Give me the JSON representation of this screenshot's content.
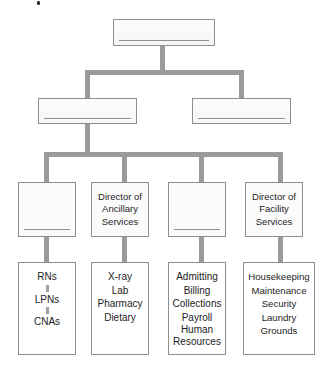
{
  "diagram": {
    "colors": {
      "connector": "#9a9a9a",
      "box_border": "#8e8e8e",
      "box_fill": "#fbfbfb",
      "text": "#1d1d1d",
      "background": "#ffffff"
    },
    "level1": {
      "nodes": [
        {
          "id": "top",
          "label": ""
        }
      ]
    },
    "level2": {
      "nodes": [
        {
          "id": "left",
          "label": ""
        },
        {
          "id": "right",
          "label": ""
        }
      ]
    },
    "level3": {
      "nodes": [
        {
          "id": "nursing",
          "lines": []
        },
        {
          "id": "ancillary",
          "lines": [
            "Director of",
            "Ancillary",
            "Services"
          ]
        },
        {
          "id": "business",
          "lines": []
        },
        {
          "id": "facility",
          "lines": [
            "Director of",
            "Facility",
            "Services"
          ]
        }
      ]
    },
    "level4": {
      "nodes": [
        {
          "id": "nursing-staff",
          "items": [
            "RNs",
            "LPNs",
            "CNAs"
          ],
          "connected": true
        },
        {
          "id": "ancillary-departments",
          "items": [
            "X-ray",
            "Lab",
            "Pharmacy",
            "Dietary"
          ],
          "connected": false
        },
        {
          "id": "business-departments",
          "items": [
            "Admitting",
            "Billing",
            "Collections",
            "Payroll",
            "Human Resources"
          ],
          "connected": false
        },
        {
          "id": "facility-departments",
          "items": [
            "Housekeeping",
            "Maintenance",
            "Security",
            "Laundry",
            "Grounds"
          ],
          "connected": false
        }
      ]
    }
  }
}
